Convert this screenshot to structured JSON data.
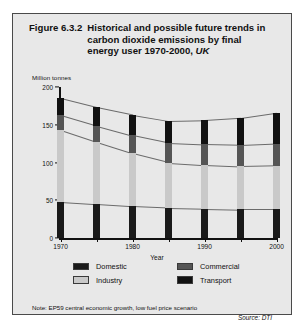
{
  "figure": {
    "number": "Figure 6.3.2",
    "title_line1": "Historical and possible future trends in",
    "title_line2": "carbon dioxide emissions by final",
    "title_line3_main": "energy user 1970-2000,",
    "title_line3_italic": "UK",
    "note": "Note: EP59 central economic growth, low fuel price scenario",
    "source": "Source: DTI"
  },
  "legend": {
    "items": [
      {
        "label": "Domestic",
        "color": "#1a1a1a"
      },
      {
        "label": "Commercial",
        "color": "#555555"
      },
      {
        "label": "Industry",
        "color": "#c9c9c9"
      },
      {
        "label": "Transport",
        "color": "#111111"
      }
    ]
  },
  "chart_data": {
    "type": "area",
    "title": "Figure 6.3.2 Historical and possible future trends in carbon dioxide emissions by final energy user 1970-2000, UK",
    "xlabel": "Year",
    "ylabel": "Million tonnes",
    "ylim": [
      0,
      200
    ],
    "yticks": [
      0,
      50,
      100,
      150,
      200
    ],
    "xticks": [
      1970,
      1975,
      1980,
      1985,
      1990,
      1995,
      2000
    ],
    "xtick_labels": [
      "1970",
      "",
      "1980",
      "",
      "1990",
      "",
      "2000"
    ],
    "grid": false,
    "legend_position": "bottom",
    "stacked": true,
    "categories": [
      1970,
      1975,
      1980,
      1985,
      1990,
      1995,
      2000
    ],
    "series": [
      {
        "name": "Domestic",
        "color": "#1a1a1a",
        "values": [
          48,
          45,
          42,
          40,
          39,
          38,
          38
        ]
      },
      {
        "name": "Industry",
        "color": "#c9c9c9",
        "values": [
          95,
          82,
          70,
          60,
          58,
          57,
          58
        ]
      },
      {
        "name": "Commercial",
        "color": "#555555",
        "values": [
          20,
          22,
          24,
          26,
          27,
          28,
          29
        ]
      },
      {
        "name": "Transport",
        "color": "#111111",
        "values": [
          22,
          24,
          27,
          29,
          32,
          36,
          41
        ]
      }
    ],
    "totals": [
      185,
      173,
      163,
      155,
      156,
      159,
      166
    ]
  }
}
